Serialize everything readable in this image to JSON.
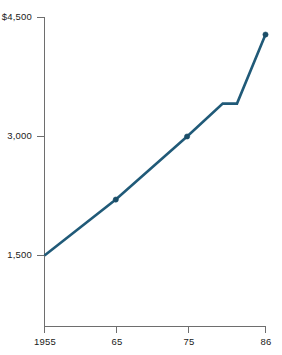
{
  "chart_data": {
    "type": "line",
    "title": "",
    "subtitle": "",
    "xlabel": "",
    "ylabel": "",
    "x": [
      1955,
      1965,
      1975,
      1980,
      1982,
      1986
    ],
    "values": [
      1500,
      2205,
      3000,
      3415,
      3415,
      4285
    ],
    "series": [
      {
        "name": "",
        "color": "#205A78",
        "points": [
          {
            "x": 1955,
            "y": 1500,
            "marker": false
          },
          {
            "x": 1965,
            "y": 2205,
            "marker": true
          },
          {
            "x": 1975,
            "y": 3000,
            "marker": true
          },
          {
            "x": 1980,
            "y": 3415,
            "marker": false
          },
          {
            "x": 1982,
            "y": 3415,
            "marker": false
          },
          {
            "x": 1986,
            "y": 4285,
            "marker": true
          }
        ]
      }
    ],
    "xlim": [
      1955,
      1986
    ],
    "ylim": [
      1500,
      4500
    ],
    "grid": false,
    "legend": false,
    "legend_position": "none",
    "x_ticks": [
      {
        "value": 1955,
        "label": "1955"
      },
      {
        "value": 1965,
        "label": "65"
      },
      {
        "value": 1975,
        "label": "75"
      },
      {
        "value": 1986,
        "label": "86"
      }
    ],
    "y_ticks": [
      {
        "value": 4500,
        "label": "$4,500"
      },
      {
        "value": 3000,
        "label": "3,000"
      },
      {
        "value": 1500,
        "label": "1,500"
      }
    ],
    "annotations": []
  },
  "axes": {
    "y_tick_top_label": "$4,500",
    "y_tick_mid_label": "3,000",
    "y_tick_bottom_label": "1,500",
    "x_tick_1_label": "1955",
    "x_tick_2_label": "65",
    "x_tick_3_label": "75",
    "x_tick_4_label": "86"
  },
  "colors": {
    "series": "#205A78",
    "marker": "#1b4e68",
    "axis": "#6e6e6e",
    "text": "#1a1a1a",
    "background": "#ffffff"
  }
}
